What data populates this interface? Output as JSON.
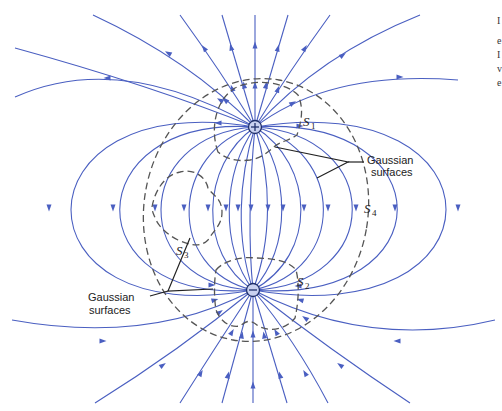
{
  "diagram": {
    "type": "electric-dipole-field-lines",
    "charges": [
      {
        "sign": "+",
        "symbol": "+",
        "x": 255,
        "y": 127
      },
      {
        "sign": "-",
        "symbol": "−",
        "x": 253,
        "y": 290
      }
    ],
    "surface_labels": {
      "s1": {
        "letter": "S",
        "sub": "1"
      },
      "s2": {
        "letter": "S",
        "sub": "2"
      },
      "s3": {
        "letter": "S",
        "sub": "3"
      },
      "s4": {
        "letter": "S",
        "sub": "4"
      }
    },
    "callouts": {
      "upper": {
        "line1": "Gaussian",
        "line2": "surfaces"
      },
      "lower": {
        "line1": "Gaussian",
        "line2": "surfaces"
      }
    },
    "truncated_caption_fragments": [
      "I",
      "e",
      "I",
      "v",
      "e"
    ],
    "colors": {
      "field_line": "#4a5fc1",
      "gaussian_surface": "#555555",
      "leader": "#222222"
    }
  }
}
